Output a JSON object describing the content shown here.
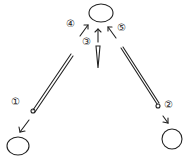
{
  "diagram": {
    "type": "hand-drawn needle direction illustration",
    "steps": [
      {
        "label": "①",
        "position": "left needle eye, pointing down-left"
      },
      {
        "label": "②",
        "position": "right needle eye, pointing down-right"
      },
      {
        "label": "③",
        "position": "center needle, pointing up"
      },
      {
        "label": "④",
        "position": "arrow up-right toward top oval"
      },
      {
        "label": "⑤",
        "position": "arrow up-left toward top oval"
      }
    ],
    "colors": {
      "stroke": "#222222",
      "background": "#ffffff"
    }
  }
}
